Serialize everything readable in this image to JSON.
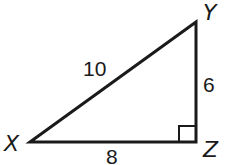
{
  "diagram": {
    "type": "right-triangle",
    "vertices": {
      "X": {
        "label": "X",
        "x": 30,
        "y": 142
      },
      "Y": {
        "label": "Y",
        "x": 196,
        "y": 22
      },
      "Z": {
        "label": "Z",
        "x": 196,
        "y": 142
      }
    },
    "sides": {
      "XY": {
        "label": "10"
      },
      "YZ": {
        "label": "6"
      },
      "XZ": {
        "label": "8"
      }
    },
    "right_angle_at": "Z",
    "stroke_color": "#1a1a1a"
  }
}
